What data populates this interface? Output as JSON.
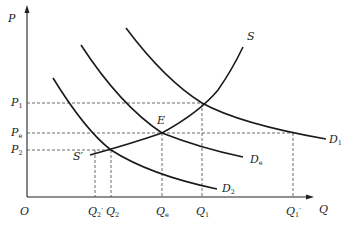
{
  "diagram": {
    "type": "supply-demand",
    "axes": {
      "y_label": "P",
      "x_label": "Q",
      "origin_label": "O"
    },
    "price_levels": [
      {
        "id": "P1",
        "main": "P",
        "sub": "1"
      },
      {
        "id": "Pe",
        "main": "P",
        "sub": "e"
      },
      {
        "id": "P2",
        "main": "P",
        "sub": "2"
      }
    ],
    "quantity_levels": [
      {
        "id": "Q2prime",
        "main": "Q",
        "sub": "2",
        "prime": "′"
      },
      {
        "id": "Q2",
        "main": "Q",
        "sub": "2"
      },
      {
        "id": "Qe",
        "main": "Q",
        "sub": "e"
      },
      {
        "id": "Q1",
        "main": "Q",
        "sub": "1"
      },
      {
        "id": "Q1prime",
        "main": "Q",
        "sub": "1",
        "prime": "′"
      }
    ],
    "curves": [
      {
        "id": "S",
        "label": "S",
        "kind": "supply"
      },
      {
        "id": "Sprime",
        "label": "S′",
        "kind": "supply-start"
      },
      {
        "id": "D1",
        "main": "D",
        "sub": "1",
        "kind": "demand"
      },
      {
        "id": "De",
        "main": "D",
        "sub": "e",
        "kind": "demand"
      },
      {
        "id": "D2",
        "main": "D",
        "sub": "2",
        "kind": "demand"
      }
    ],
    "points": [
      {
        "id": "E",
        "label": "E"
      }
    ]
  }
}
